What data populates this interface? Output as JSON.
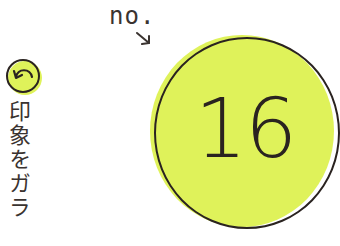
{
  "back_button": {
    "icon": "undo-arrow-icon"
  },
  "vertical_text": "印象をガラ",
  "number_label": {
    "prefix": "no.",
    "value": "16",
    "arrow_icon": "arrow-down-right-icon"
  },
  "colors": {
    "accent": "#dff25a",
    "ink": "#2a2320",
    "background": "#ffffff"
  }
}
